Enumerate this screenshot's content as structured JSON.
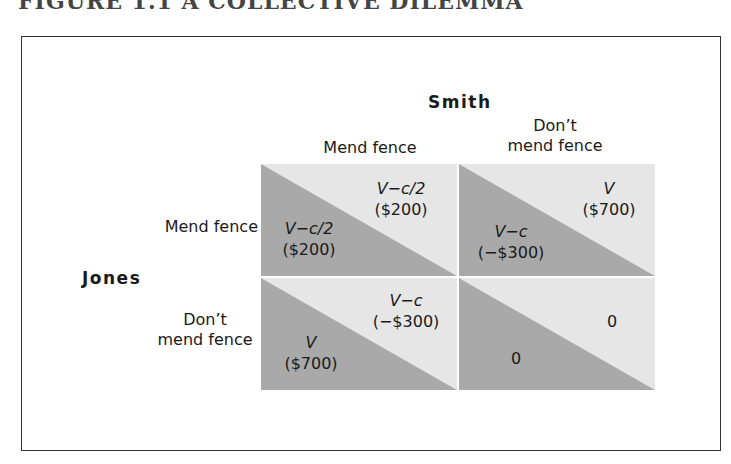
{
  "figure": {
    "title": "FIGURE 1.1  A COLLECTIVE DILEMMA"
  },
  "players": {
    "column": "Smith",
    "row": "Jones"
  },
  "column_strategies": [
    "Mend fence",
    "Don’t mend fence"
  ],
  "column_strategies_lines": [
    [
      "Mend fence"
    ],
    [
      "Don’t",
      "mend fence"
    ]
  ],
  "row_strategies_lines": [
    [
      "Mend fence"
    ],
    [
      "Don’t",
      "mend fence"
    ]
  ],
  "colors": {
    "dark_triangle": "#a9a9a9",
    "light_triangle": "#e6e6e6",
    "frame": "#333333"
  },
  "cells": [
    {
      "row": "Mend fence",
      "col": "Mend fence",
      "jones": {
        "expr": "V−c/2",
        "value": "($200)"
      },
      "smith": {
        "expr": "V−c/2",
        "value": "($200)"
      }
    },
    {
      "row": "Mend fence",
      "col": "Don’t mend fence",
      "jones": {
        "expr": "V−c",
        "value": "(−$300)"
      },
      "smith": {
        "expr": "V",
        "value": "($700)"
      }
    },
    {
      "row": "Don’t mend fence",
      "col": "Mend fence",
      "jones": {
        "expr": "V",
        "value": "($700)"
      },
      "smith": {
        "expr": "V−c",
        "value": "(−$300)"
      }
    },
    {
      "row": "Don’t mend fence",
      "col": "Don’t mend fence",
      "jones": {
        "expr": "",
        "value": "0"
      },
      "smith": {
        "expr": "",
        "value": "0"
      }
    }
  ]
}
